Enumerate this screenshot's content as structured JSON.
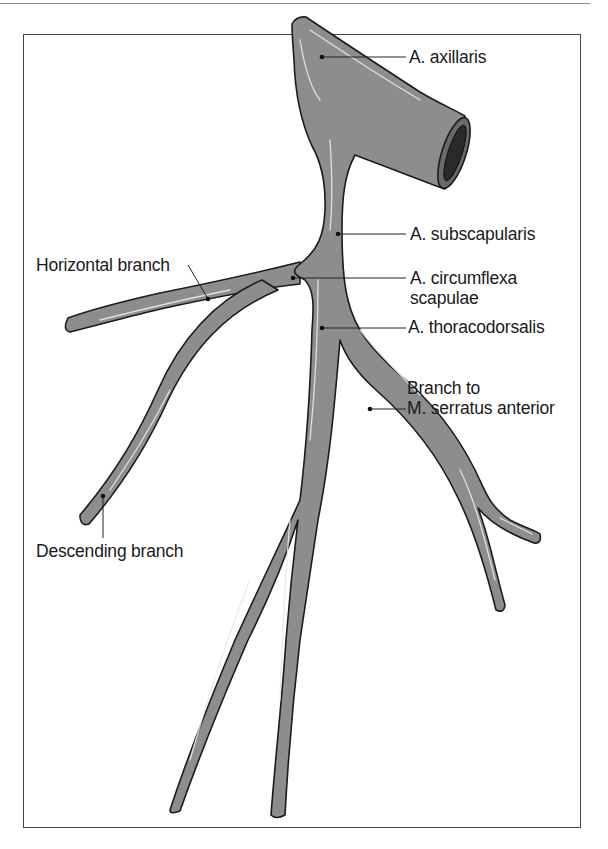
{
  "figure": {
    "type": "anatomical-illustration",
    "colors": {
      "vessel_fill": "#8d8d8d",
      "vessel_outline": "#1b1b1b",
      "highlight": "#e9e9e9",
      "frame": "#444444",
      "background": "#ffffff"
    }
  },
  "labels": {
    "axillaris": "A. axillaris",
    "subscapularis": "A. subscapularis",
    "circumflexa_line1": "A. circumflexa",
    "circumflexa_line2": "scapulae",
    "thoracodorsalis": "A. thoracodorsalis",
    "serratus_line1": "Branch to",
    "serratus_line2": "M. serratus anterior",
    "horizontal": "Horizontal branch",
    "descending": "Descending branch"
  }
}
